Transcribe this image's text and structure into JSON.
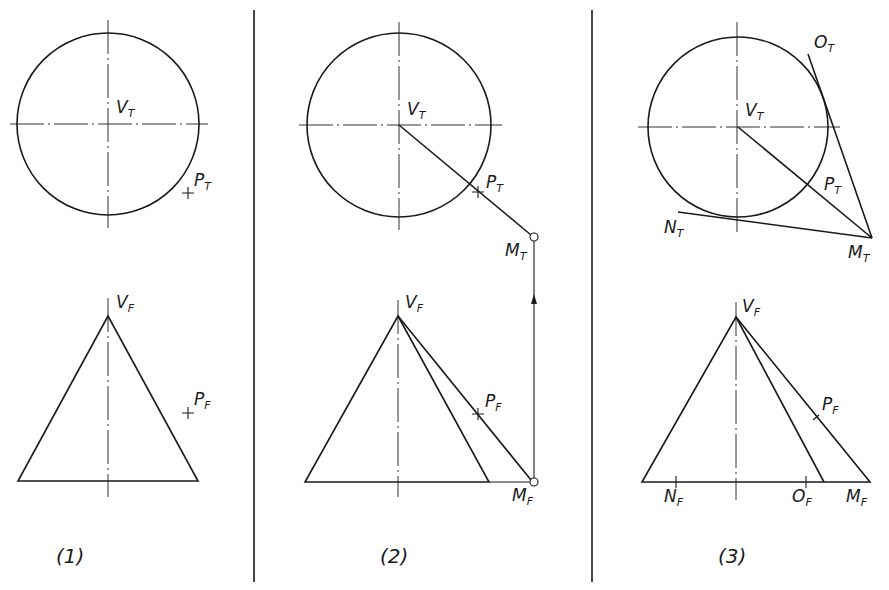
{
  "figure": {
    "panels": [
      {
        "caption": "(1)",
        "labels": {
          "vt": "V",
          "vt_sub": "T",
          "pt": "P",
          "pt_sub": "T",
          "vf": "V",
          "vf_sub": "F",
          "pf": "P",
          "pf_sub": "F"
        }
      },
      {
        "caption": "(2)",
        "labels": {
          "vt": "V",
          "vt_sub": "T",
          "pt": "P",
          "pt_sub": "T",
          "mt": "M",
          "mt_sub": "T",
          "vf": "V",
          "vf_sub": "F",
          "pf": "P",
          "pf_sub": "F",
          "mf": "M",
          "mf_sub": "F"
        }
      },
      {
        "caption": "(3)",
        "labels": {
          "vt": "V",
          "vt_sub": "T",
          "pt": "P",
          "pt_sub": "T",
          "ot": "O",
          "ot_sub": "T",
          "nt": "N",
          "nt_sub": "T",
          "mt": "M",
          "mt_sub": "T",
          "vf": "V",
          "vf_sub": "F",
          "pf": "P",
          "pf_sub": "F",
          "nf": "N",
          "nf_sub": "F",
          "of": "O",
          "of_sub": "F",
          "mf": "M",
          "mf_sub": "F"
        }
      }
    ]
  }
}
